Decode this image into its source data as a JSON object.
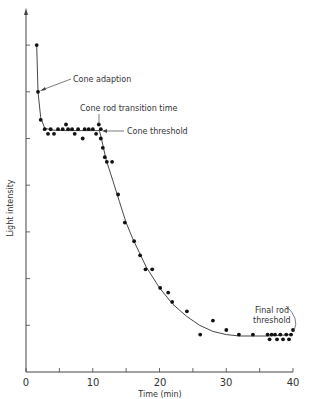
{
  "chart_data": {
    "type": "scatter",
    "title": "",
    "xlabel": "Time (min)",
    "ylabel": "Light intensity",
    "xlim": [
      0,
      40
    ],
    "ylim": [
      0,
      7.5
    ],
    "x_ticks": [
      0,
      5,
      10,
      15,
      20,
      25,
      30,
      35,
      40
    ],
    "x_tick_labels": [
      "0",
      "10",
      "20",
      "30",
      "40"
    ],
    "x_tick_label_values": [
      0,
      10,
      20,
      30,
      40
    ],
    "y_ticks": [
      1,
      2,
      3,
      4,
      5,
      6,
      7
    ],
    "y_tick_labels": [],
    "grid": false,
    "legend": null,
    "series": [
      {
        "name": "Measured threshold",
        "style": "points",
        "points": [
          [
            1.6,
            7.0
          ],
          [
            1.8,
            6.0
          ],
          [
            2.2,
            5.4
          ],
          [
            2.8,
            5.2
          ],
          [
            3.3,
            5.1
          ],
          [
            3.7,
            5.2
          ],
          [
            4.2,
            5.1
          ],
          [
            4.8,
            5.2
          ],
          [
            5.5,
            5.2
          ],
          [
            6.0,
            5.3
          ],
          [
            6.3,
            5.2
          ],
          [
            6.9,
            5.2
          ],
          [
            7.3,
            5.1
          ],
          [
            7.8,
            5.2
          ],
          [
            8.5,
            5.0
          ],
          [
            8.8,
            5.2
          ],
          [
            9.4,
            5.2
          ],
          [
            10.0,
            5.2
          ],
          [
            10.5,
            5.1
          ],
          [
            10.9,
            5.3
          ],
          [
            11.2,
            5.2
          ],
          [
            11.2,
            5.0
          ],
          [
            11.5,
            4.8
          ],
          [
            11.8,
            4.6
          ],
          [
            12.1,
            4.5
          ],
          [
            12.9,
            4.5
          ],
          [
            13.8,
            3.8
          ],
          [
            14.8,
            3.2
          ],
          [
            16.2,
            2.8
          ],
          [
            17.1,
            2.5
          ],
          [
            17.9,
            2.2
          ],
          [
            18.9,
            2.2
          ],
          [
            20.1,
            1.8
          ],
          [
            21.3,
            1.7
          ],
          [
            21.9,
            1.5
          ],
          [
            24.1,
            1.3
          ],
          [
            26.1,
            0.8
          ],
          [
            28.0,
            1.1
          ],
          [
            30.0,
            0.9
          ],
          [
            31.9,
            0.8
          ],
          [
            34.0,
            0.8
          ],
          [
            36.2,
            0.8
          ],
          [
            36.5,
            0.7
          ],
          [
            36.8,
            0.8
          ],
          [
            37.3,
            0.8
          ],
          [
            37.6,
            0.7
          ],
          [
            38.1,
            0.8
          ],
          [
            38.5,
            0.7
          ],
          [
            39.0,
            0.8
          ],
          [
            39.4,
            0.7
          ],
          [
            39.7,
            0.8
          ],
          [
            40.0,
            0.9
          ]
        ]
      },
      {
        "name": "Fitted curve",
        "style": "line",
        "points": [
          [
            1.6,
            7.0
          ],
          [
            1.8,
            6.0
          ],
          [
            2.2,
            5.45
          ],
          [
            2.8,
            5.22
          ],
          [
            4,
            5.18
          ],
          [
            6,
            5.17
          ],
          [
            8,
            5.17
          ],
          [
            10,
            5.17
          ],
          [
            11.0,
            5.17
          ],
          [
            11.3,
            5.0
          ],
          [
            12,
            4.55
          ],
          [
            13,
            4.1
          ],
          [
            14,
            3.65
          ],
          [
            15,
            3.2
          ],
          [
            16,
            2.85
          ],
          [
            17,
            2.55
          ],
          [
            18,
            2.25
          ],
          [
            20,
            1.8
          ],
          [
            22,
            1.45
          ],
          [
            24,
            1.2
          ],
          [
            26,
            1.0
          ],
          [
            28,
            0.87
          ],
          [
            30,
            0.8
          ],
          [
            32,
            0.77
          ],
          [
            36,
            0.77
          ],
          [
            40,
            0.8
          ]
        ]
      }
    ],
    "annotations": [
      {
        "text": "Cone adaption",
        "target": [
          1.8,
          6.0
        ]
      },
      {
        "text": "Cone rod transition time",
        "target": [
          11.2,
          5.3
        ]
      },
      {
        "text": "Cone threshold",
        "target": [
          11.3,
          5.17
        ]
      },
      {
        "text": "Final rod threshold",
        "target": [
          40.0,
          0.85
        ]
      }
    ]
  },
  "labels": {
    "xlabel": "Time (min)",
    "ylabel": "Light intensity",
    "cone_adaption": "Cone adaption",
    "transition": "Cone rod transition time",
    "cone_threshold": "Cone threshold",
    "final_rod_1": "Final rod",
    "final_rod_2": "threshold",
    "tick_0": "0",
    "tick_10": "10",
    "tick_20": "20",
    "tick_30": "30",
    "tick_40": "40"
  }
}
